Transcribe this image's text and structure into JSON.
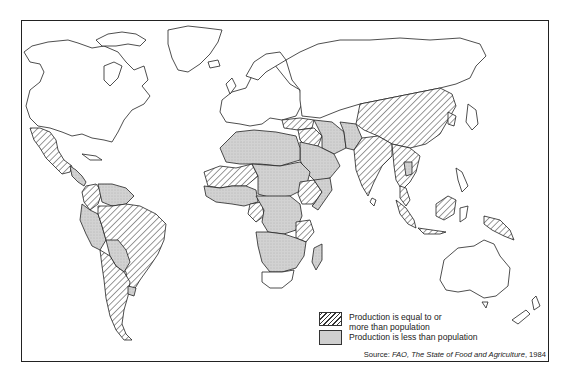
{
  "map": {
    "subject": "World food production relative to population",
    "regions": {
      "equal_or_more": [
        "Mexico",
        "Central America (parts)",
        "Colombia",
        "Brazil",
        "Argentina",
        "Chile",
        "Uruguay",
        "Ivory Coast/Ghana region",
        "Senegal/Mali region",
        "Cameroon",
        "Ethiopia region",
        "Tanzania",
        "Turkey",
        "Syria/Iraq region",
        "India",
        "China",
        "Burma",
        "Thailand",
        "Vietnam",
        "Malaysia",
        "Sumatra",
        "Borneo",
        "Java",
        "Papua New Guinea",
        "Philippines (parts)"
      ],
      "less_than": [
        "Morocco",
        "Algeria",
        "Libya",
        "Egypt",
        "Sudan",
        "Chad",
        "Niger",
        "Nigeria",
        "Central Africa",
        "Zaire",
        "Angola",
        "Zambia",
        "Mozambique",
        "Zimbabwe",
        "Namibia",
        "Botswana",
        "Madagascar",
        "Saudi Arabia",
        "Iran",
        "Pakistan",
        "Afghanistan",
        "Venezuela",
        "Peru",
        "Bolivia",
        "Paraguay",
        "Ecuador",
        "Guyana",
        "Cambodia",
        "Laos"
      ],
      "not_classified": [
        "Canada",
        "United States",
        "Greenland",
        "Europe",
        "USSR",
        "Japan",
        "Mongolia",
        "Australia",
        "New Zealand",
        "South Africa"
      ]
    }
  },
  "legend": {
    "items": [
      {
        "pattern": "hatched",
        "label_line1": "Production is equal to or",
        "label_line2": "more than population"
      },
      {
        "pattern": "stippled-gray",
        "label_line1": "Production is less than population"
      }
    ]
  },
  "source": {
    "prefix": "Source: ",
    "title": "FAO, The State of Food and Agriculture",
    "year": ", 1984"
  },
  "colors": {
    "outline": "#222222",
    "stipple_fill": "#cfcfcf",
    "hatch": "#333333",
    "background": "#ffffff"
  }
}
